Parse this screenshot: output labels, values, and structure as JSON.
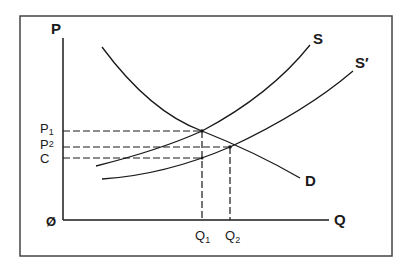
{
  "diagram": {
    "type": "supply-demand",
    "axes": {
      "y_label": "P",
      "x_label": "Q",
      "origin_label": "Ø"
    },
    "curves": {
      "demand": {
        "label": "D"
      },
      "supply": {
        "label": "S"
      },
      "supply_shifted": {
        "label": "S′"
      }
    },
    "price_levels": [
      {
        "label": "P",
        "sub": "1"
      },
      {
        "label": "P",
        "sub": "2"
      },
      {
        "label": "C",
        "sub": ""
      }
    ],
    "quantity_levels": [
      {
        "label": "Q",
        "sub": "1"
      },
      {
        "label": "Q",
        "sub": "2"
      }
    ]
  },
  "colors": {
    "line": "#1a1a1a",
    "frame": "#444444",
    "background": "#ffffff"
  }
}
